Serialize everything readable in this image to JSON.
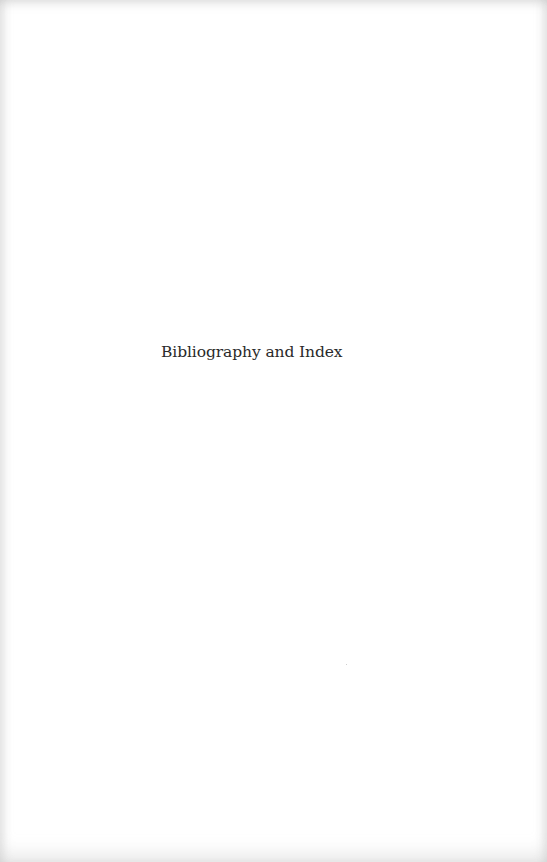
{
  "page": {
    "type": "part-divider",
    "title": "Bibliography and Index"
  },
  "colors": {
    "background": "#ffffff",
    "text": "#2a2a2a",
    "edge_shadow": "#bebebe"
  }
}
